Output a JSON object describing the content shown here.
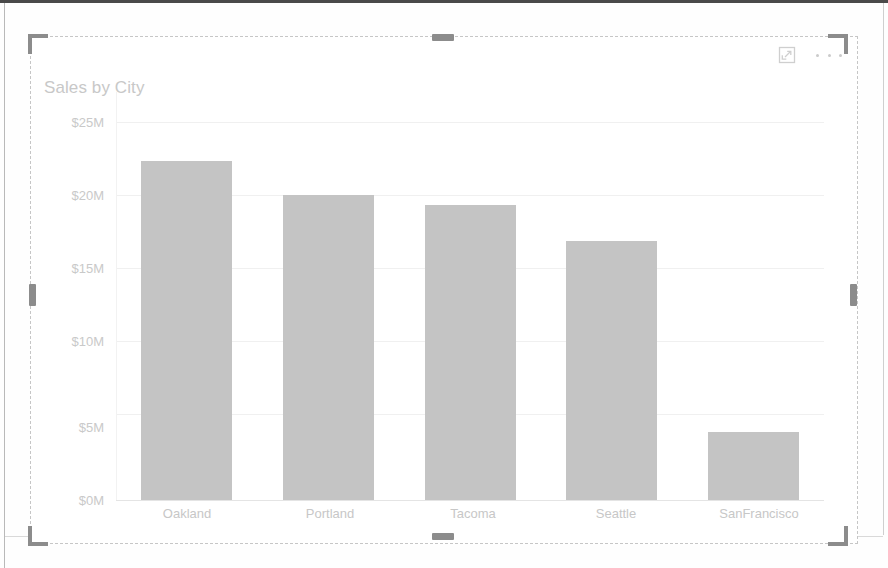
{
  "visual": {
    "title": "Sales by City",
    "header_icons": [
      {
        "name": "focus-mode-icon",
        "label": "Focus mode"
      },
      {
        "name": "more-options-icon",
        "label": "More options"
      }
    ]
  },
  "chart_data": {
    "type": "bar",
    "title": "Sales by City",
    "xlabel": "",
    "ylabel": "",
    "categories": [
      "Oakland",
      "Portland",
      "Tacoma",
      "Seattle",
      "SanFrancisco"
    ],
    "values": [
      22.4,
      20.2,
      19.5,
      17.1,
      4.5
    ],
    "value_unit": "M",
    "value_prefix": "$",
    "ylim": [
      0,
      25
    ],
    "yticks": [
      0,
      5,
      10,
      15,
      20,
      25
    ],
    "ytick_labels": [
      "$0M",
      "$5M",
      "$10M",
      "$15M",
      "$20M",
      "$25M"
    ],
    "grid": true,
    "legend": false,
    "series": [
      {
        "name": "Sales",
        "values": [
          22.4,
          20.2,
          19.5,
          17.1,
          4.5
        ]
      }
    ],
    "colors": {
      "bar": "#c4c4c4",
      "gridline": "#f0f0f0",
      "axis_text": "#c8c8c8",
      "title_text": "#c8c8c8",
      "background": "#ffffff"
    }
  },
  "selection": {
    "handles": [
      "top-left",
      "top-center",
      "top-right",
      "middle-left",
      "middle-right",
      "bottom-left",
      "bottom-center",
      "bottom-right"
    ]
  }
}
